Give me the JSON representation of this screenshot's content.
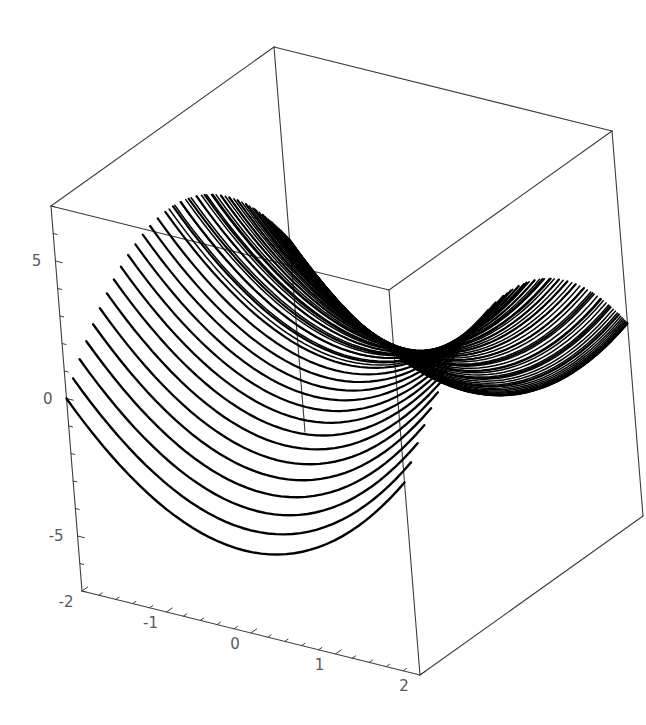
{
  "figure": {
    "kind": "3d-surface-plot",
    "style": "mathematica-wireframe",
    "background_color": "#ffffff",
    "curve_color": "#000000",
    "frame_color": "#3c3c3c",
    "label_color": "#555a5e",
    "width": 646,
    "height": 725
  },
  "axes": {
    "x": {
      "label": "",
      "ticks": [
        "-2",
        "-1",
        "0",
        "1",
        "2"
      ],
      "tick_values": [
        -2,
        -1,
        0,
        1,
        2
      ],
      "range": [
        -2,
        2
      ],
      "minor_ticks_per_interval": 4
    },
    "y": {
      "label": "",
      "ticks": [],
      "range": [
        -2,
        2
      ]
    },
    "z": {
      "label": "",
      "ticks": [
        "5",
        "0",
        "-5"
      ],
      "tick_values": [
        5,
        0,
        -5
      ],
      "range": [
        -7,
        7
      ],
      "minor_ticks_per_interval": 4
    }
  },
  "chart_data": {
    "type": "line",
    "title": "",
    "subtitle": "",
    "xlabel": "",
    "ylabel": "",
    "zlabel": "",
    "xlim": [
      -2,
      2
    ],
    "ylim": [
      -2,
      2
    ],
    "zlim": [
      -7,
      7
    ],
    "grid": false,
    "legend": null,
    "projection": "3d-parallel",
    "surface_expression": "z = x^2 - y^2",
    "num_curves": 30,
    "curve_parameter": "y",
    "curve_parameter_values": [
      -2,
      -1.862,
      -1.724,
      -1.586,
      -1.448,
      -1.31,
      -1.172,
      -1.034,
      -0.897,
      -0.759,
      -0.621,
      -0.483,
      -0.345,
      -0.207,
      -0.069,
      0.069,
      0.207,
      0.345,
      0.483,
      0.621,
      0.759,
      0.897,
      1.034,
      1.172,
      1.31,
      1.448,
      1.586,
      1.724,
      1.862,
      2
    ],
    "samples_per_curve": 41,
    "x_tick_labels": [
      "-2",
      "-1",
      "0",
      "1",
      "2"
    ],
    "z_tick_labels": [
      "5",
      "0",
      "-5"
    ]
  },
  "frame": {
    "corners_2d": {
      "top_back_left": [
        51,
        206
      ],
      "top_back_center": [
        274,
        47
      ],
      "top_back_right": [
        612,
        131
      ],
      "top_front_center": [
        398,
        291
      ],
      "bottom_back_left": [
        97,
        528
      ],
      "bottom_front_center": [
        420,
        675
      ],
      "bottom_right": [
        568,
        436
      ]
    },
    "visible_edges": 9
  }
}
